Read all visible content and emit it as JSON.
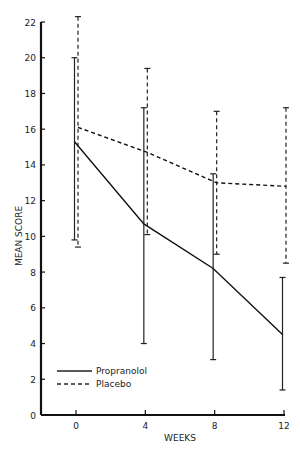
{
  "chart_data": {
    "type": "line",
    "title": "",
    "xlabel": "WEEKS",
    "ylabel": "MEAN SCORE",
    "x": [
      0,
      4,
      8,
      12
    ],
    "xticks": [
      "0",
      "4",
      "8",
      "12"
    ],
    "yticks": [
      "0",
      "2",
      "4",
      "6",
      "8",
      "10",
      "12",
      "14",
      "16",
      "18",
      "20",
      "22"
    ],
    "ylim": [
      0,
      22
    ],
    "xlim": [
      -2,
      12
    ],
    "grid": false,
    "legend_position": "lower left",
    "series": [
      {
        "name": "Propranolol",
        "style": "solid",
        "values": [
          15.3,
          10.7,
          8.2,
          4.5
        ],
        "error_upper": [
          20.0,
          17.2,
          13.5,
          7.7
        ],
        "error_lower": [
          9.8,
          4.0,
          3.1,
          1.4
        ]
      },
      {
        "name": "Placebo",
        "style": "dashed",
        "values": [
          16.1,
          14.7,
          13.0,
          12.8
        ],
        "error_upper": [
          22.3,
          19.4,
          17.0,
          17.2
        ],
        "error_lower": [
          9.4,
          10.1,
          9.0,
          8.5
        ]
      }
    ]
  },
  "legend": {
    "items": [
      {
        "label": "Propranolol"
      },
      {
        "label": "Placebo"
      }
    ]
  }
}
